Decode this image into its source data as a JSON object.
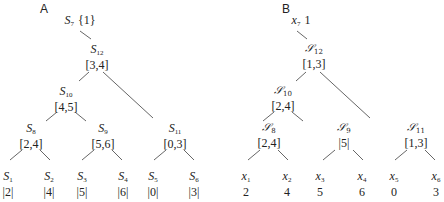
{
  "panels": {
    "a": {
      "label": "A",
      "root": {
        "name": "S",
        "sub": "7",
        "value": "{1}"
      },
      "nodes": [
        {
          "id": "s12",
          "name": "S",
          "sub": "12",
          "value": "[3,4]"
        },
        {
          "id": "s10",
          "name": "S",
          "sub": "10",
          "value": "[4,5]"
        },
        {
          "id": "s8",
          "name": "S",
          "sub": "8",
          "value": "[2,4]"
        },
        {
          "id": "s9",
          "name": "S",
          "sub": "9",
          "value": "[5,6]"
        },
        {
          "id": "s11",
          "name": "S",
          "sub": "11",
          "value": "[0,3]"
        }
      ],
      "leaves": [
        {
          "name": "S",
          "sub": "1",
          "value": "|2|"
        },
        {
          "name": "S",
          "sub": "2",
          "value": "|4|"
        },
        {
          "name": "S",
          "sub": "3",
          "value": "|5|"
        },
        {
          "name": "S",
          "sub": "4",
          "value": "|6|"
        },
        {
          "name": "S",
          "sub": "5",
          "value": "|0|"
        },
        {
          "name": "S",
          "sub": "6",
          "value": "|3|"
        }
      ]
    },
    "b": {
      "label": "B",
      "root": {
        "name": "x",
        "sub": "7",
        "value": "1"
      },
      "nodes": [
        {
          "id": "s12",
          "name": "𝒮",
          "sub": "12",
          "value": "[1,3]"
        },
        {
          "id": "s10",
          "name": "𝒮",
          "sub": "10",
          "value": "[2,4]"
        },
        {
          "id": "s8",
          "name": "𝒮",
          "sub": "8",
          "value": "[2,4]"
        },
        {
          "id": "s9",
          "name": "𝒮",
          "sub": "9",
          "value": "|5|"
        },
        {
          "id": "s11",
          "name": "𝒮",
          "sub": "11",
          "value": "[1,3]"
        }
      ],
      "leaves": [
        {
          "name": "x",
          "sub": "1",
          "value": "2"
        },
        {
          "name": "x",
          "sub": "2",
          "value": "4"
        },
        {
          "name": "x",
          "sub": "3",
          "value": "5"
        },
        {
          "name": "x",
          "sub": "4",
          "value": "6"
        },
        {
          "name": "x",
          "sub": "5",
          "value": "0"
        },
        {
          "name": "x",
          "sub": "6",
          "value": "3"
        }
      ]
    }
  }
}
